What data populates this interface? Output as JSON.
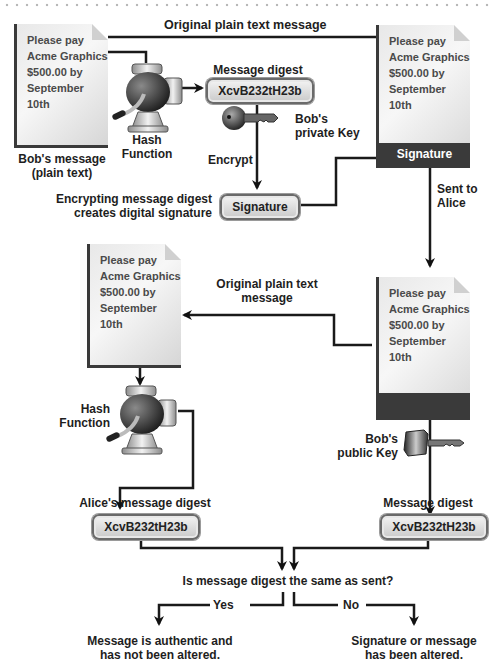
{
  "header": {
    "decoration": "dotted-rule"
  },
  "message_text": [
    "Please pay",
    "Acme Graphics",
    "$500.00 by",
    "September 10th"
  ],
  "sender": {
    "doc_caption": [
      "Bob's message",
      "(plain text)"
    ],
    "hash_label": [
      "Hash",
      "Function"
    ],
    "digest_title": "Message digest",
    "digest_value": "XcvB232tH23b",
    "private_key_label": [
      "Bob's",
      "private Key"
    ],
    "encrypt_label": "Encrypt",
    "signature_pill": "Signature",
    "signature_caption": [
      "Encrypting message digest",
      "creates digital signature"
    ],
    "top_arrow_label": "Original plain text message",
    "signed_doc_bar": "Signature",
    "sent_label": [
      "Sent to",
      "Alice"
    ]
  },
  "receiver": {
    "plain_arrow_label": [
      "Original plain text",
      "message"
    ],
    "hash_label": [
      "Hash",
      "Function"
    ],
    "alice_digest_title": "Alice's message digest",
    "alice_digest_value": "XcvB232tH23b",
    "public_key_label": [
      "Bob's",
      "public Key"
    ],
    "decrypted_digest_title": "Message digest",
    "decrypted_digest_value": "XcvB232tH23b"
  },
  "decision": {
    "question": "Is message digest the same as sent?",
    "yes_label": "Yes",
    "no_label": "No",
    "yes_result": [
      "Message is authentic and",
      "has not been altered."
    ],
    "no_result": [
      "Signature or message",
      "has been altered."
    ]
  }
}
